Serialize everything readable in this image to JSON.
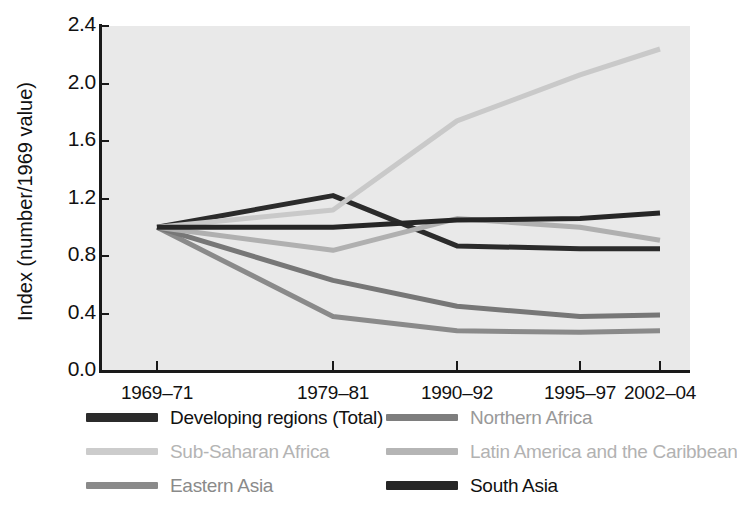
{
  "chart_data": {
    "type": "line",
    "title": "",
    "xlabel": "",
    "ylabel": "Index (number/1969 value)",
    "categories": [
      "1969–71",
      "1979–81",
      "1990–92",
      "1995–97",
      "2002–04"
    ],
    "ylim": [
      0.0,
      2.4
    ],
    "yticks": [
      "0.0",
      "0.4",
      "0.8",
      "1.2",
      "1.6",
      "2.0",
      "2.4"
    ],
    "ytick_values": [
      0.0,
      0.4,
      0.8,
      1.2,
      1.6,
      2.0,
      2.4
    ],
    "grid": false,
    "legend_position": "bottom",
    "plot_background": "#e9e9e9",
    "series": [
      {
        "name": "Developing regions (Total)",
        "color": "#2b2b2b",
        "width": 5,
        "values": [
          1.0,
          1.22,
          0.87,
          0.85,
          0.85
        ]
      },
      {
        "name": "Sub-Saharan Africa",
        "color": "#c9c9c9",
        "width": 5,
        "values": [
          1.0,
          1.12,
          1.74,
          2.06,
          2.24
        ]
      },
      {
        "name": "Eastern Asia",
        "color": "#8a8a8a",
        "width": 5,
        "values": [
          1.0,
          0.38,
          0.28,
          0.27,
          0.28
        ]
      },
      {
        "name": "Northern Africa",
        "color": "#777777",
        "width": 5,
        "values": [
          1.0,
          0.63,
          0.45,
          0.38,
          0.39
        ]
      },
      {
        "name": "Latin America and the Caribbean",
        "color": "#b0b0b0",
        "width": 5,
        "values": [
          1.0,
          0.84,
          1.06,
          1.0,
          0.91
        ]
      },
      {
        "name": "South Asia",
        "color": "#262626",
        "width": 5,
        "values": [
          1.0,
          1.0,
          1.05,
          1.06,
          1.1
        ]
      }
    ]
  },
  "axis": {
    "y_title": "Index (number/1969 value)"
  },
  "legend": {
    "columns": [
      {
        "items": [
          {
            "label": "Developing regions (Total)",
            "color": "#2b2b2b",
            "text_color": "#111111",
            "thick": true
          },
          {
            "label": "Sub-Saharan Africa",
            "color": "#cccccc",
            "text_color": "#b4b4b4",
            "thick": false
          },
          {
            "label": "Eastern Asia",
            "color": "#8a8a8a",
            "text_color": "#8a8a8a",
            "thick": false
          }
        ]
      },
      {
        "items": [
          {
            "label": "Northern Africa",
            "color": "#7e7e7e",
            "text_color": "#999999",
            "thick": false
          },
          {
            "label": "Latin America and the Caribbean",
            "color": "#b5b5b5",
            "text_color": "#b2b2b2",
            "thick": false
          },
          {
            "label": "South Asia",
            "color": "#262626",
            "text_color": "#111111",
            "thick": true
          }
        ]
      }
    ]
  }
}
